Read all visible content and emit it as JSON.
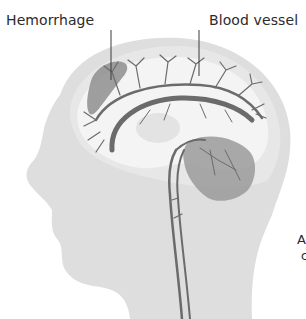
{
  "diagram": {
    "type": "medical-illustration",
    "labels": {
      "hemorrhage": "Hemorrhage",
      "blood_vessel": "Blood vessel"
    },
    "caption_fragments": {
      "line1": "A",
      "line2": "c"
    },
    "colors": {
      "head": "#dedede",
      "head_outer_brain": "#e6e6e6",
      "brain": "#f3f3f3",
      "vessel": "#6b6b6b",
      "hemorrhage": "#8e8e8e",
      "cerebellum": "#9a9a9a",
      "label_line": "#3a3a3a",
      "text": "#2b2b2b"
    }
  }
}
